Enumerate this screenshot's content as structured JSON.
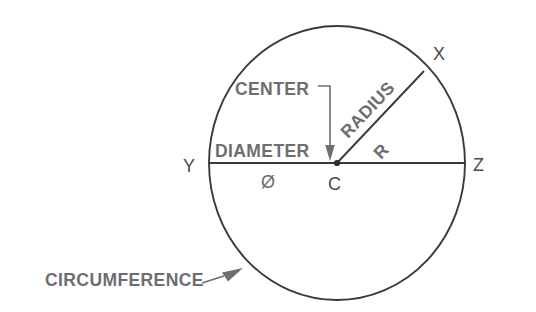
{
  "diagram": {
    "background_color": "#ffffff",
    "line_color": "#3a3a3c",
    "label_color": "#6e6e70",
    "vertex_color": "#4a4a4c",
    "labels": {
      "center": "CENTER",
      "diameter": "DIAMETER",
      "diameter_symbol": "Ø",
      "radius": "RADIUS",
      "radius_symbol": "R",
      "circumference": "CIRCUMFERENCE",
      "point_x": "X",
      "point_y": "Y",
      "point_z": "Z",
      "point_c": "C"
    },
    "geometry": {
      "center_x": 337,
      "center_y": 163,
      "radius_x": 128,
      "radius_y": 137,
      "diameter_endpoints": [
        "Y",
        "Z"
      ],
      "radius_endpoints": [
        "C",
        "X"
      ],
      "radius_angle_degrees": 42
    }
  }
}
